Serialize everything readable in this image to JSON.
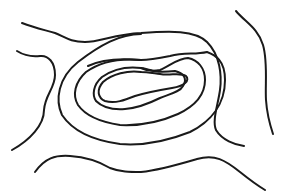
{
  "figure": {
    "type": "topographic-contour-sketch",
    "stroke_color": "#1a1a1a",
    "background": "#ffffff",
    "stroke_width": 2,
    "contours": [
      {
        "name": "outer-top-right-arc",
        "d": "M22,23 C35,28 45,30 55,33 C65,37 70,42 85,42 C100,42 115,34 141,33 C170,31 195,30 207,42 C220,55 222,75 220,90 C218,105 212,120 216,130 C222,140 235,145 244,146"
      },
      {
        "name": "right-edge-line",
        "d": "M236,11 C245,22 258,28 263,45 C268,62 265,85 266,100 C267,115 270,125 273,134"
      },
      {
        "name": "left-edge-line",
        "d": "M17,51 C25,56 32,57 40,56 C48,55 55,62 55,75 C55,88 45,95 44,110 C44,125 30,140 12,150"
      },
      {
        "name": "bottom-line",
        "d": "M35,172 C45,158 55,155 70,156 C85,157 100,162 110,168 C120,172 130,172 141,172 C160,170 180,164 197,159 C215,154 225,160 240,172 C250,180 260,187 265,190"
      },
      {
        "name": "ring-3",
        "d": "M141,34 C120,34 100,45 78,62 C58,78 55,100 62,115 C72,130 90,140 120,144 C145,146 170,140 190,132 C210,122 225,105 225,80 C225,60 215,55 207,52 C195,55 185,52 170,56 C160,58 150,60 141,60 C120,58 100,60 88,66"
      },
      {
        "name": "ring-2",
        "d": "M141,60 C120,58 100,62 86,72 C75,82 72,95 78,105 C85,115 100,122 120,125 C140,126 160,122 178,114 C195,106 205,95 205,80 C205,68 198,60 188,58 C178,58 170,66 160,70 C150,72 145,70 141,68"
      },
      {
        "name": "ring-1",
        "d": "M141,68 C125,66 112,70 102,77 C93,85 92,95 96,101 C102,107 112,110 125,109 C138,108 150,103 160,98 C170,94 180,92 183,86 C188,78 183,73 175,71 C165,72 155,72 150,70 C146,69 143,68 141,68"
      },
      {
        "name": "ring-0-inner",
        "d": "M141,72 C128,70 112,74 103,82 C96,90 98,98 105,101 C115,104 125,100 135,96 C148,92 160,90 172,88 C185,86 190,80 186,76 C180,72 170,76 160,74 C152,73 146,72 141,72"
      }
    ]
  }
}
